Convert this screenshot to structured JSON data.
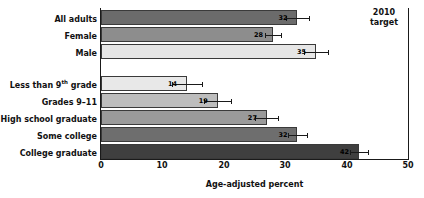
{
  "chart_data": {
    "type": "bar",
    "orientation": "horizontal",
    "title": "",
    "xlabel": "Age-adjusted percent",
    "ylabel": "",
    "xlim": [
      0,
      50
    ],
    "xticks": [
      0,
      10,
      20,
      30,
      40,
      50
    ],
    "grid": false,
    "legend": "none",
    "categories": [
      "All adults",
      "Female",
      "Male",
      "Less than 9th grade",
      "Grades 9–11",
      "High school graduate",
      "Some college",
      "College graduate"
    ],
    "values": [
      32,
      28,
      35,
      14,
      19,
      27,
      32,
      42
    ],
    "value_labels": [
      "32",
      "28",
      "35",
      "14",
      "19",
      "27",
      "32",
      "42"
    ],
    "error_high": [
      33.8,
      29.3,
      37.0,
      16.5,
      21.2,
      28.9,
      33.6,
      43.5
    ],
    "error_low": [
      30.2,
      26.7,
      33.0,
      11.5,
      16.8,
      25.1,
      30.4,
      40.5
    ],
    "bar_colors": [
      "#6b6b6b",
      "#8d8d8d",
      "#e6e6e6",
      "#e8e8e8",
      "#bdbdbd",
      "#9a9a9a",
      "#6e6e6e",
      "#3f3f3f"
    ],
    "annotations": [
      {
        "name": "target-line",
        "label_line1": "2010",
        "label_line2": "target",
        "x": 50
      }
    ]
  },
  "axis": {
    "x_title": "Age-adjusted percent",
    "tick_labels": [
      "0",
      "10",
      "20",
      "30",
      "40",
      "50"
    ]
  },
  "categories": [
    {
      "label_prefix": "All adults",
      "sup": "",
      "label_suffix": ""
    },
    {
      "label_prefix": "Female",
      "sup": "",
      "label_suffix": ""
    },
    {
      "label_prefix": "Male",
      "sup": "",
      "label_suffix": ""
    },
    {
      "label_prefix": "Less than 9",
      "sup": "th",
      "label_suffix": " grade"
    },
    {
      "label_prefix": "Grades 9–11",
      "sup": "",
      "label_suffix": ""
    },
    {
      "label_prefix": "High school graduate",
      "sup": "",
      "label_suffix": ""
    },
    {
      "label_prefix": "Some college",
      "sup": "",
      "label_suffix": ""
    },
    {
      "label_prefix": "College graduate",
      "sup": "",
      "label_suffix": ""
    }
  ],
  "target": {
    "line1": "2010",
    "line2": "target"
  },
  "colors": {
    "axis": "#1a1a1a",
    "text": "#111111",
    "background": "#ffffff"
  }
}
